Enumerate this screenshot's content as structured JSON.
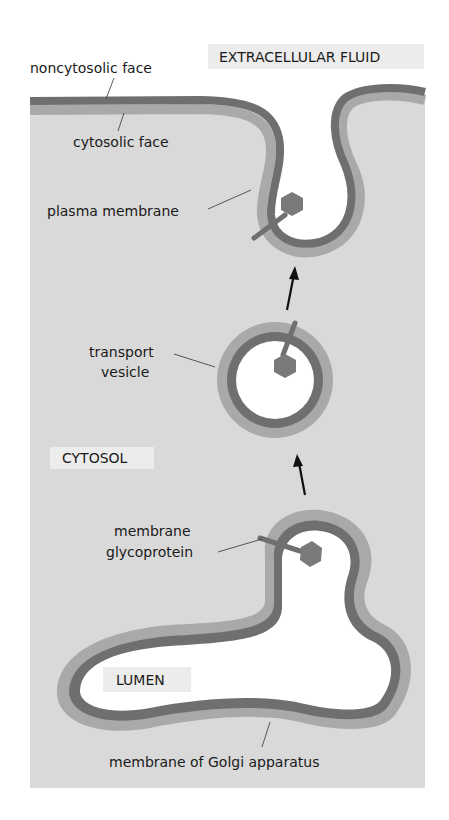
{
  "diagram": {
    "type": "cell-biology-schematic",
    "colors": {
      "background": "#ffffff",
      "cytosol": "#d9d9d9",
      "noncytosolic_face": "#6f6f6f",
      "cytosolic_face": "#a9a9a9",
      "lumen": "#ffffff",
      "protein": "#707070",
      "region_label_bg": "#ececec"
    },
    "region_labels": {
      "extracellular": "EXTRACELLULAR FLUID",
      "cytosol": "CYTOSOL",
      "lumen": "LUMEN"
    },
    "annotations": {
      "noncytosolic_face": "noncytosolic face",
      "cytosolic_face": "cytosolic face",
      "plasma_membrane": "plasma membrane",
      "transport_vesicle_1": "transport",
      "transport_vesicle_2": "vesicle",
      "glycoprotein_1": "membrane",
      "glycoprotein_2": "glycoprotein",
      "golgi_membrane": "membrane of Golgi apparatus"
    },
    "arrows": [
      {
        "from": "Golgi apparatus",
        "to": "transport vesicle"
      },
      {
        "from": "transport vesicle",
        "to": "plasma membrane"
      }
    ]
  }
}
